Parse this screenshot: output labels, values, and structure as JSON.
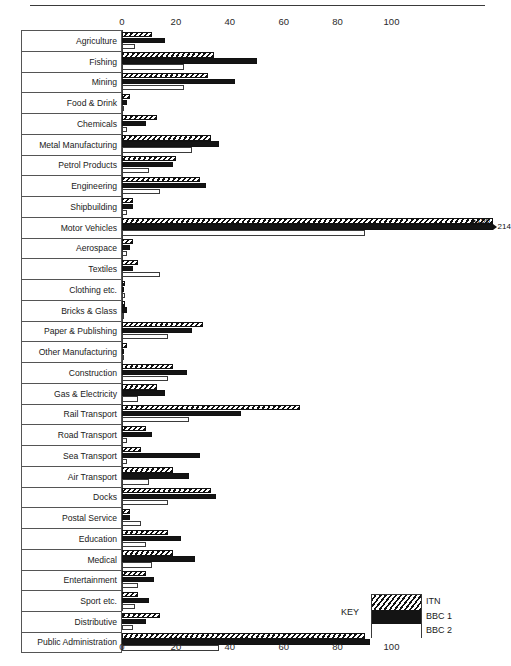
{
  "chart_data": {
    "type": "bar",
    "orientation": "horizontal",
    "title": "",
    "subtitle": "",
    "xlabel": "",
    "ylabel": "",
    "xlim": [
      0,
      120
    ],
    "xticks": [
      0,
      20,
      40,
      60,
      80,
      100
    ],
    "grid": false,
    "axis_positions": [
      "top",
      "bottom"
    ],
    "legend_position": "bottom-right",
    "legend_title": "KEY",
    "categories": [
      "Agriculture",
      "Fishing",
      "Mining",
      "Food & Drink",
      "Chemicals",
      "Metal Manufacturing",
      "Petrol Products",
      "Engineering",
      "Shipbuilding",
      "Motor Vehicles",
      "Aerospace",
      "Textiles",
      "Clothing etc.",
      "Bricks & Glass",
      "Paper & Publishing",
      "Other Manufacturing",
      "Construction",
      "Gas & Electricity",
      "Rail Transport",
      "Road Transport",
      "Sea Transport",
      "Air Transport",
      "Docks",
      "Postal Service",
      "Education",
      "Medical",
      "Entertainment",
      "Sport etc.",
      "Distributive",
      "Public Administration"
    ],
    "series": [
      {
        "name": "ITN",
        "color": "#111111",
        "pattern": "diagonal-hatch",
        "values": [
          11,
          34,
          32,
          3,
          13,
          33,
          20,
          29,
          4,
          196,
          4,
          6,
          1,
          1,
          30,
          2,
          19,
          13,
          66,
          9,
          7,
          19,
          33,
          3,
          17,
          19,
          9,
          6,
          14,
          90
        ]
      },
      {
        "name": "BBC 1",
        "color": "#141414",
        "pattern": "solid",
        "values": [
          16,
          50,
          42,
          2,
          9,
          36,
          19,
          31,
          4,
          214,
          3,
          4,
          0,
          2,
          26,
          0,
          24,
          16,
          44,
          11,
          29,
          25,
          35,
          3,
          22,
          27,
          12,
          10,
          9,
          92
        ]
      },
      {
        "name": "BBC 2",
        "color": "#ffffff",
        "pattern": "open",
        "values": [
          5,
          23,
          23,
          0,
          2,
          26,
          10,
          14,
          2,
          90,
          2,
          14,
          1,
          0,
          17,
          0,
          17,
          6,
          25,
          2,
          2,
          10,
          17,
          7,
          9,
          11,
          6,
          5,
          4,
          36
        ]
      }
    ],
    "annotations": [
      {
        "category": "Motor Vehicles",
        "series": "ITN",
        "value": 196,
        "label": "196"
      },
      {
        "category": "Motor Vehicles",
        "series": "BBC 1",
        "value": 214,
        "label": "214"
      }
    ]
  }
}
